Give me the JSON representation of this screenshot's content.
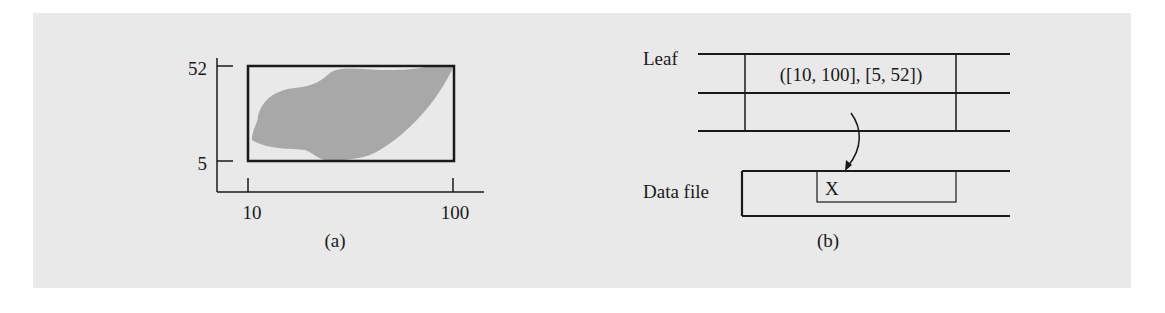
{
  "figure": {
    "background_color": "#e9e9e9",
    "shape_color": "#a8a8a8",
    "line_color": "#1a1a1a"
  },
  "panel_a": {
    "caption": "(a)",
    "y_ticks": [
      "52",
      "5"
    ],
    "x_ticks": [
      "10",
      "100"
    ],
    "bounding_box": {
      "x_range": [
        10,
        100
      ],
      "y_range": [
        5,
        52
      ]
    }
  },
  "panel_b": {
    "caption": "(b)",
    "leaf_label": "Leaf",
    "leaf_entry": "([10, 100], [5, 52])",
    "data_file_label": "Data file",
    "record_label": "X"
  }
}
